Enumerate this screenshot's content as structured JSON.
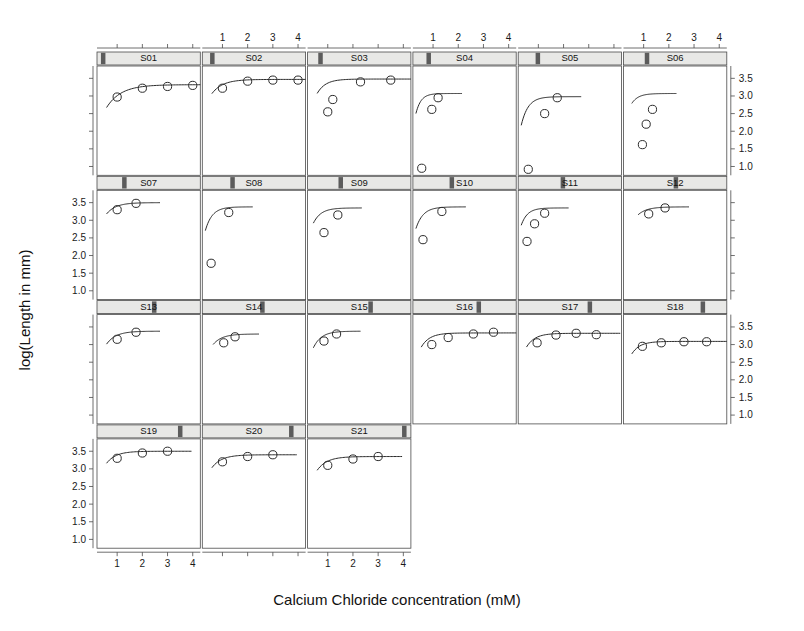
{
  "chart_data": {
    "type": "scatter",
    "title": "",
    "subtitle": "",
    "xlabel": "Calcium Chloride concentration (mM)",
    "ylabel": "log(Length in mm)",
    "xlim": [
      0.2,
      4.3
    ],
    "ylim": [
      0.75,
      3.85
    ],
    "xticks": [
      1,
      2,
      3,
      4
    ],
    "xticklabels": [
      "1",
      "2",
      "3",
      "4"
    ],
    "yticks": [
      1.0,
      1.5,
      2.0,
      2.5,
      3.0,
      3.5
    ],
    "yticklabels": [
      "1.0",
      "1.5",
      "2.0",
      "2.5",
      "3.0",
      "3.5"
    ],
    "grid": false,
    "legend": "none",
    "layout": {
      "rows": 4,
      "cols": 6,
      "panel_count": 21,
      "strip_style": "shingle-bar",
      "marker": "open-circle",
      "fit_curve": "asymptotic-regression"
    },
    "panels": [
      {
        "label": "S01",
        "strip_pos": 0.02,
        "x": [
          0.5,
          1.0,
          2.0,
          3.0,
          4.0
        ],
        "y": [
          null,
          2.97,
          3.22,
          3.27,
          3.3
        ],
        "points": [
          [
            1.0,
            2.97
          ],
          [
            2.0,
            3.22
          ],
          [
            3.0,
            3.27
          ],
          [
            4.0,
            3.3
          ]
        ],
        "curve": {
          "asym": 3.32,
          "r0": 1.55,
          "lrc": 0.55
        }
      },
      {
        "label": "S02",
        "strip_pos": 0.06,
        "points": [
          [
            1.0,
            3.22
          ],
          [
            2.0,
            3.42
          ],
          [
            3.0,
            3.45
          ],
          [
            4.0,
            3.45
          ]
        ],
        "curve": {
          "asym": 3.47,
          "r0": 1.9,
          "lrc": 0.85
        }
      },
      {
        "label": "S03",
        "strip_pos": 0.09,
        "points": [
          [
            1.0,
            2.55
          ],
          [
            1.2,
            2.9
          ],
          [
            2.3,
            3.4
          ],
          [
            3.5,
            3.45
          ]
        ],
        "curve": {
          "asym": 3.48,
          "r0": 1.15,
          "lrc": 1.1
        }
      },
      {
        "label": "S04",
        "strip_pos": 0.12,
        "points": [
          [
            0.55,
            0.95
          ],
          [
            0.95,
            2.62
          ],
          [
            1.2,
            2.95
          ]
        ],
        "curve": {
          "asym": 3.07,
          "r0": 0.3,
          "lrc": 1.6
        }
      },
      {
        "label": "S05",
        "strip_pos": 0.16,
        "points": [
          [
            0.6,
            0.92
          ],
          [
            1.25,
            2.5
          ],
          [
            1.75,
            2.95
          ]
        ],
        "curve": {
          "asym": 2.98,
          "r0": 0.35,
          "lrc": 1.3
        }
      },
      {
        "label": "S06",
        "strip_pos": 0.2,
        "points": [
          [
            0.95,
            1.62
          ],
          [
            1.1,
            2.2
          ],
          [
            1.35,
            2.62
          ]
        ],
        "curve": {
          "asym": 3.07,
          "r0": 0.9,
          "lrc": 1.35
        }
      },
      {
        "label": "S07",
        "strip_pos": 0.24,
        "points": [
          [
            1.0,
            3.3
          ],
          [
            1.75,
            3.48
          ]
        ],
        "curve": {
          "asym": 3.5,
          "r0": 1.95,
          "lrc": 1.0
        }
      },
      {
        "label": "S08",
        "strip_pos": 0.27,
        "points": [
          [
            0.55,
            1.78
          ],
          [
            1.25,
            3.22
          ]
        ],
        "curve": {
          "asym": 3.38,
          "r0": 1.2,
          "lrc": 1.3
        }
      },
      {
        "label": "S09",
        "strip_pos": 0.3,
        "points": [
          [
            0.85,
            2.65
          ],
          [
            1.4,
            3.15
          ]
        ],
        "curve": {
          "asym": 3.35,
          "r0": 1.55,
          "lrc": 1.2
        }
      },
      {
        "label": "S10",
        "strip_pos": 0.36,
        "points": [
          [
            0.6,
            2.45
          ],
          [
            1.35,
            3.25
          ]
        ],
        "curve": {
          "asym": 3.38,
          "r0": 1.5,
          "lrc": 1.25
        }
      },
      {
        "label": "S11",
        "strip_pos": 0.42,
        "points": [
          [
            0.55,
            2.4
          ],
          [
            0.85,
            2.9
          ],
          [
            1.25,
            3.2
          ]
        ],
        "curve": {
          "asym": 3.35,
          "r0": 1.55,
          "lrc": 1.4
        }
      },
      {
        "label": "S12",
        "strip_pos": 0.5,
        "points": [
          [
            1.2,
            3.18
          ],
          [
            1.85,
            3.35
          ]
        ],
        "curve": {
          "asym": 3.38,
          "r0": 1.3,
          "lrc": 1.05
        }
      },
      {
        "label": "S13",
        "strip_pos": 0.55,
        "points": [
          [
            1.0,
            3.15
          ],
          [
            1.75,
            3.35
          ]
        ],
        "curve": {
          "asym": 3.38,
          "r0": 1.6,
          "lrc": 1.0
        }
      },
      {
        "label": "S14",
        "strip_pos": 0.58,
        "points": [
          [
            1.05,
            3.05
          ],
          [
            1.5,
            3.22
          ]
        ],
        "curve": {
          "asym": 3.3,
          "r0": 1.5,
          "lrc": 1.05
        }
      },
      {
        "label": "S15",
        "strip_pos": 0.61,
        "points": [
          [
            0.85,
            3.1
          ],
          [
            1.35,
            3.3
          ]
        ],
        "curve": {
          "asym": 3.38,
          "r0": 1.55,
          "lrc": 1.15
        }
      },
      {
        "label": "S16",
        "strip_pos": 0.64,
        "points": [
          [
            0.95,
            3.0
          ],
          [
            1.6,
            3.2
          ],
          [
            2.6,
            3.3
          ],
          [
            3.4,
            3.35
          ]
        ],
        "curve": {
          "asym": 3.33,
          "r0": 1.35,
          "lrc": 1.1
        }
      },
      {
        "label": "S17",
        "strip_pos": 0.7,
        "points": [
          [
            0.95,
            3.05
          ],
          [
            1.7,
            3.27
          ],
          [
            2.5,
            3.32
          ],
          [
            3.3,
            3.28
          ]
        ],
        "curve": {
          "asym": 3.32,
          "r0": 1.4,
          "lrc": 1.1
        }
      },
      {
        "label": "S18",
        "strip_pos": 0.78,
        "points": [
          [
            0.95,
            2.95
          ],
          [
            1.7,
            3.05
          ],
          [
            2.6,
            3.08
          ],
          [
            3.5,
            3.08
          ]
        ],
        "curve": {
          "asym": 3.09,
          "r0": 1.2,
          "lrc": 1.15
        }
      },
      {
        "label": "S19",
        "strip_pos": 0.82,
        "points": [
          [
            1.0,
            3.3
          ],
          [
            2.0,
            3.45
          ],
          [
            3.0,
            3.5
          ]
        ],
        "curve": {
          "asym": 3.5,
          "r0": 1.85,
          "lrc": 1.0
        }
      },
      {
        "label": "S20",
        "strip_pos": 0.88,
        "points": [
          [
            1.0,
            3.2
          ],
          [
            2.0,
            3.35
          ],
          [
            3.0,
            3.4
          ]
        ],
        "curve": {
          "asym": 3.4,
          "r0": 1.75,
          "lrc": 0.95
        }
      },
      {
        "label": "S21",
        "strip_pos": 0.96,
        "points": [
          [
            1.0,
            3.1
          ],
          [
            2.0,
            3.28
          ],
          [
            3.0,
            3.35
          ]
        ],
        "curve": {
          "asym": 3.35,
          "r0": 1.6,
          "lrc": 0.95
        }
      }
    ]
  },
  "colors": {
    "line": "#2b2b2b",
    "marker_stroke": "#2b2b2b",
    "marker_fill": "none",
    "panel_border": "#4a4a4a",
    "strip_fill": "#e8e8e6",
    "strip_indicator": "#5c5c5c",
    "text": "#1a1a1a",
    "background": "#ffffff"
  }
}
